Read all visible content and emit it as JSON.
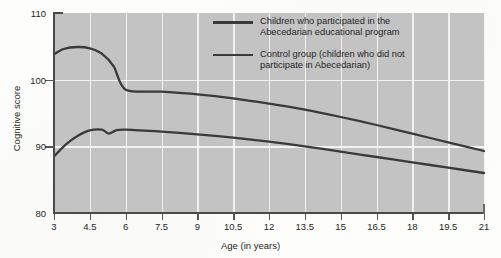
{
  "chart_data": {
    "type": "line",
    "title": "",
    "xlabel": "Age (in years)",
    "ylabel": "Cognitive score",
    "xlim": [
      3,
      21
    ],
    "ylim": [
      80,
      110
    ],
    "xticks": [
      "3",
      "4.5",
      "6",
      "7.5",
      "9",
      "10.5",
      "12",
      "13.5",
      "15",
      "16.5",
      "18",
      "19.5",
      "21"
    ],
    "yticks": [
      "80",
      "90",
      "100",
      "110"
    ],
    "grid": "both",
    "legend_position": "inside-top-right",
    "series": [
      {
        "name": "Children who participated in the Abecedarian educational program",
        "color": "#3a3a3a",
        "x": [
          3,
          3.4,
          4,
          4.5,
          5,
          5.5,
          6,
          7.5,
          9,
          10.5,
          12,
          13.5,
          15,
          16.5,
          18,
          19.5,
          21
        ],
        "values": [
          103.8,
          104.6,
          104.9,
          104.7,
          103.9,
          102.0,
          98.5,
          98.2,
          97.8,
          97.2,
          96.4,
          95.5,
          94.4,
          93.2,
          91.9,
          90.6,
          89.3
        ]
      },
      {
        "name": "Control group (children who did not participate in Abecedarian)",
        "color": "#3a3a3a",
        "x": [
          3,
          3.5,
          4,
          4.5,
          5,
          5.3,
          5.6,
          6,
          7.5,
          9,
          10.5,
          12,
          13.5,
          15,
          16.5,
          18,
          19.5,
          21
        ],
        "values": [
          88.5,
          90.3,
          91.6,
          92.4,
          92.5,
          91.9,
          92.4,
          92.5,
          92.2,
          91.8,
          91.3,
          90.7,
          90.0,
          89.2,
          88.4,
          87.6,
          86.8,
          86.0
        ]
      }
    ]
  },
  "legend": {
    "items": [
      {
        "line1": "Children who participated in the",
        "line2": "Abecedarian educational program"
      },
      {
        "line1": "Control group (children who did not",
        "line2": "participate in Abecedarian)"
      }
    ]
  },
  "axes": {
    "x_title": "Age (in years)",
    "y_title": "Cognitive score"
  },
  "colors": {
    "plot_background": "#c3c3c3",
    "gridline": "#f3f3f1",
    "line": "#3a3a3a",
    "axis": "#4a4a4a",
    "page_background": "#fdfdfb"
  }
}
